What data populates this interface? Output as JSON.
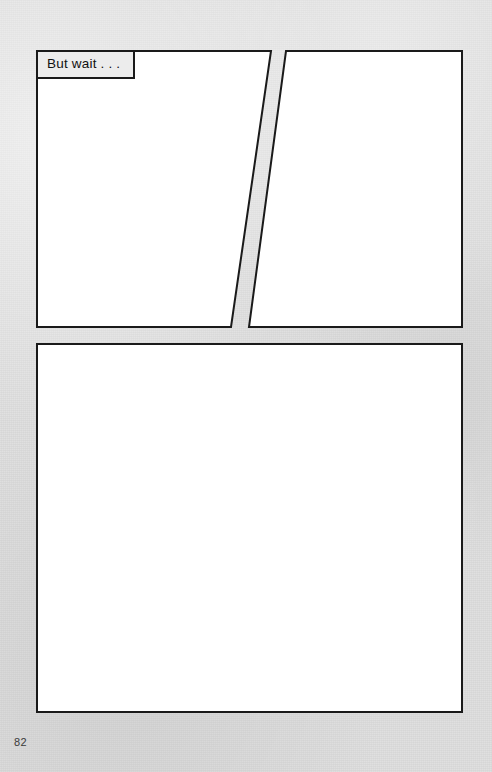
{
  "page": {
    "width": 492,
    "height": 772,
    "background_color": "#dcdcdc",
    "panel_fill_color": "#ffffff",
    "panel_border_color": "#1a1a1a",
    "page_number": "82"
  },
  "panels": [
    {
      "id": "panel-1",
      "shape": "quadrilateral",
      "points": "37,51 271,51 231,327 37,327",
      "content": ""
    },
    {
      "id": "panel-2",
      "shape": "quadrilateral",
      "points": "286,51 462,51 462,327 249,327",
      "content": ""
    },
    {
      "id": "panel-3",
      "shape": "rectangle",
      "points": "37,344 462,344 462,712 37,712",
      "content": ""
    }
  ],
  "caption": {
    "text": "But wait . . .",
    "panel": "panel-1",
    "x": 36,
    "y": 50,
    "width": 99,
    "height": 29,
    "fill_color": "#ececec",
    "border_color": "#1a1a1a"
  }
}
